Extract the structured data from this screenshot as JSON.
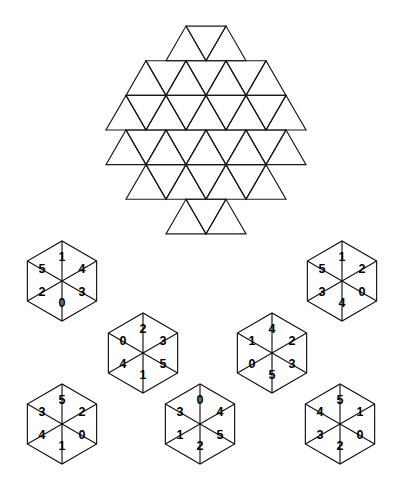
{
  "page": {
    "background_color": "#ffffff",
    "line_color": "#1a1a1a",
    "text_color": "#000000",
    "width": 404,
    "height": 496
  },
  "board": {
    "name": "hexagonal triangular board",
    "shape": "hexagon",
    "triangle_edge": 40,
    "center_x": 206,
    "center_y": 130,
    "rows": [
      {
        "index": 0,
        "up_count": 2,
        "down_count": 1,
        "start_offset": 2
      },
      {
        "index": 1,
        "up_count": 4,
        "down_count": 3,
        "start_offset": 1
      },
      {
        "index": 2,
        "up_count": 5,
        "down_count": 4,
        "start_offset": 0
      },
      {
        "index": 3,
        "up_count": 5,
        "down_count": 4,
        "start_offset": 0
      },
      {
        "index": 4,
        "up_count": 4,
        "down_count": 3,
        "start_offset": 1
      },
      {
        "index": 5,
        "up_count": 2,
        "down_count": 1,
        "start_offset": 2
      }
    ],
    "labels": []
  },
  "pieces": [
    {
      "id": "piece-1",
      "name": "hexagon-piece-top-left",
      "cx": 62,
      "cy": 281,
      "radius": 40,
      "values": {
        "top": "1",
        "upper_right": "4",
        "lower_right": "3",
        "bottom": "0",
        "lower_left": "2",
        "upper_left": "5"
      },
      "clockwise_from_top": [
        "1",
        "4",
        "3",
        "0",
        "2",
        "5"
      ]
    },
    {
      "id": "piece-2",
      "name": "hexagon-piece-top-right",
      "cx": 342,
      "cy": 281,
      "radius": 40,
      "values": {
        "top": "1",
        "upper_right": "2",
        "lower_right": "0",
        "bottom": "4",
        "lower_left": "3",
        "upper_left": "5"
      },
      "clockwise_from_top": [
        "1",
        "2",
        "0",
        "4",
        "3",
        "5"
      ]
    },
    {
      "id": "piece-3",
      "name": "hexagon-piece-middle-left",
      "cx": 143,
      "cy": 353,
      "radius": 40,
      "values": {
        "top": "2",
        "upper_right": "3",
        "lower_right": "5",
        "bottom": "1",
        "lower_left": "4",
        "upper_left": "0"
      },
      "clockwise_from_top": [
        "2",
        "3",
        "5",
        "1",
        "4",
        "0"
      ]
    },
    {
      "id": "piece-4",
      "name": "hexagon-piece-middle-right",
      "cx": 272,
      "cy": 353,
      "radius": 40,
      "values": {
        "top": "4",
        "upper_right": "2",
        "lower_right": "3",
        "bottom": "5",
        "lower_left": "0",
        "upper_left": "1"
      },
      "clockwise_from_top": [
        "4",
        "2",
        "3",
        "5",
        "0",
        "1"
      ]
    },
    {
      "id": "piece-5",
      "name": "hexagon-piece-bottom-left",
      "cx": 62,
      "cy": 424,
      "radius": 40,
      "values": {
        "top": "5",
        "upper_right": "2",
        "lower_right": "0",
        "bottom": "1",
        "lower_left": "4",
        "upper_left": "3"
      },
      "clockwise_from_top": [
        "5",
        "2",
        "0",
        "1",
        "4",
        "3"
      ]
    },
    {
      "id": "piece-6",
      "name": "hexagon-piece-bottom-middle",
      "cx": 200,
      "cy": 424,
      "radius": 40,
      "values": {
        "top": "0",
        "upper_right": "4",
        "lower_right": "5",
        "bottom": "2",
        "lower_left": "1",
        "upper_left": "3"
      },
      "clockwise_from_top": [
        "0",
        "4",
        "5",
        "2",
        "1",
        "3"
      ]
    },
    {
      "id": "piece-7",
      "name": "hexagon-piece-bottom-right",
      "cx": 340,
      "cy": 424,
      "radius": 40,
      "values": {
        "top": "5",
        "upper_right": "1",
        "lower_right": "0",
        "bottom": "2",
        "lower_left": "3",
        "upper_left": "4"
      },
      "clockwise_from_top": [
        "5",
        "1",
        "0",
        "2",
        "3",
        "4"
      ]
    }
  ]
}
